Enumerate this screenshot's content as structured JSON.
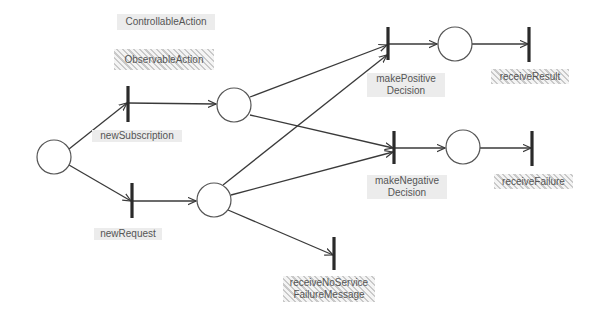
{
  "legend": {
    "controllable": "ControllableAction",
    "observable": "ObservableAction"
  },
  "colors": {
    "stroke": "#3a3a3a",
    "text": "#555555",
    "controllable_fill": "#ececec",
    "observable_hatch": "#c9c9c9"
  },
  "places": [
    {
      "id": "p0",
      "cx": 54,
      "cy": 157,
      "r": 17
    },
    {
      "id": "p1",
      "cx": 234,
      "cy": 105,
      "r": 17
    },
    {
      "id": "p2",
      "cx": 214,
      "cy": 200,
      "r": 17
    },
    {
      "id": "p3",
      "cx": 455,
      "cy": 44,
      "r": 17
    },
    {
      "id": "p4",
      "cx": 463,
      "cy": 147,
      "r": 17
    }
  ],
  "transitions": {
    "newSubscription": {
      "line1": "newSubscription",
      "line2": "",
      "kind": "controllable"
    },
    "newRequest": {
      "line1": "newRequest",
      "line2": "",
      "kind": "controllable"
    },
    "makePositive": {
      "line1": "makePositive",
      "line2": "Decision",
      "kind": "controllable"
    },
    "makeNegative": {
      "line1": "makeNegative",
      "line2": "Decision",
      "kind": "controllable"
    },
    "receiveResult": {
      "line1": "receiveResult",
      "line2": "",
      "kind": "observable"
    },
    "receiveFailure": {
      "line1": "receiveFailure",
      "line2": "",
      "kind": "observable"
    },
    "receiveNoService": {
      "line1": "receiveNoService",
      "line2": "FailureMessage",
      "kind": "observable"
    }
  }
}
